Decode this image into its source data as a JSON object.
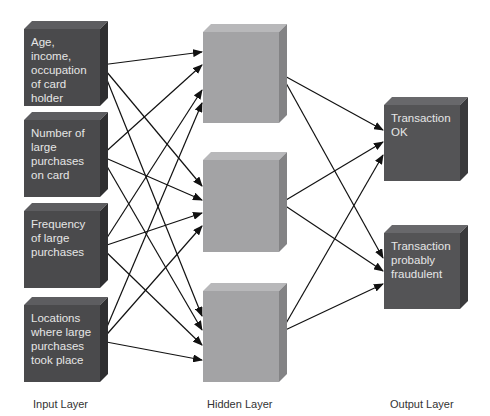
{
  "diagram": {
    "colors": {
      "input_box": "#4a4a4c",
      "hidden_box": "#a3a3a5",
      "output_box": "#545456",
      "text_on_dark": "#e6e6e6",
      "arrow": "#111111",
      "label": "#333333"
    },
    "layers": {
      "input": {
        "label": "Input Layer",
        "nodes": [
          {
            "id": "in1",
            "text": "Age, income, occupation of card holder"
          },
          {
            "id": "in2",
            "text": "Number of large purchases on card"
          },
          {
            "id": "in3",
            "text": "Frequency of large purchases"
          },
          {
            "id": "in4",
            "text": "Locations where large purchases took place"
          }
        ]
      },
      "hidden": {
        "label": "Hidden Layer",
        "nodes": [
          {
            "id": "h1",
            "text": ""
          },
          {
            "id": "h2",
            "text": ""
          },
          {
            "id": "h3",
            "text": ""
          }
        ]
      },
      "output": {
        "label": "Output Layer",
        "nodes": [
          {
            "id": "o1",
            "text": "Transaction OK"
          },
          {
            "id": "o2",
            "text": "Transaction probably fraudulent"
          }
        ]
      }
    },
    "edges": [
      {
        "from": "in1",
        "to": "h1"
      },
      {
        "from": "in1",
        "to": "h2"
      },
      {
        "from": "in1",
        "to": "h3"
      },
      {
        "from": "in2",
        "to": "h1"
      },
      {
        "from": "in2",
        "to": "h2"
      },
      {
        "from": "in2",
        "to": "h3"
      },
      {
        "from": "in3",
        "to": "h1"
      },
      {
        "from": "in3",
        "to": "h2"
      },
      {
        "from": "in3",
        "to": "h3"
      },
      {
        "from": "in4",
        "to": "h1"
      },
      {
        "from": "in4",
        "to": "h2"
      },
      {
        "from": "in4",
        "to": "h3"
      },
      {
        "from": "h1",
        "to": "o1"
      },
      {
        "from": "h1",
        "to": "o2"
      },
      {
        "from": "h2",
        "to": "o1"
      },
      {
        "from": "h2",
        "to": "o2"
      },
      {
        "from": "h3",
        "to": "o1"
      },
      {
        "from": "h3",
        "to": "o2"
      }
    ]
  }
}
